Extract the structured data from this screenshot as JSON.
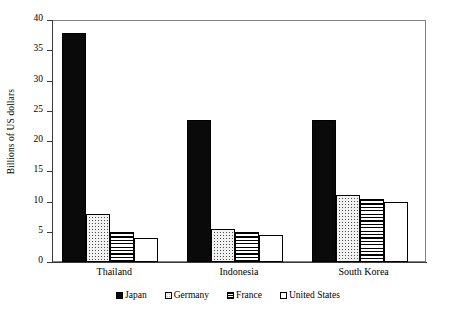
{
  "chart_data": {
    "type": "bar",
    "title": "",
    "subtitle": "",
    "xlabel": "",
    "ylabel": "Billions of US dollars",
    "ylim": [
      0,
      40
    ],
    "yticks": [
      0,
      5,
      10,
      15,
      20,
      25,
      30,
      35,
      40
    ],
    "ytick_labels": [
      "0",
      "5",
      "10",
      "15",
      "20",
      "25",
      "30",
      "35",
      "40"
    ],
    "grid": false,
    "legend_position": "bottom-center",
    "categories": [
      "Thailand",
      "Indonesia",
      "South Korea"
    ],
    "series": [
      {
        "name": "Japan",
        "pattern": "solid-black",
        "color": "#0a0a0a",
        "values": [
          37.8,
          23.5,
          23.5
        ]
      },
      {
        "name": "Germany",
        "pattern": "dotted",
        "color": "#f2f2f2",
        "values": [
          8.0,
          5.4,
          11.0
        ]
      },
      {
        "name": "France",
        "pattern": "horizontal-stripes",
        "color": "#ffffff",
        "values": [
          5.0,
          4.9,
          10.4
        ]
      },
      {
        "name": "United States",
        "pattern": "empty-white",
        "color": "#ffffff",
        "values": [
          4.0,
          4.5,
          10.0
        ]
      }
    ]
  },
  "legend": {
    "items": [
      {
        "label": "Japan",
        "key": "japan"
      },
      {
        "label": "Germany",
        "key": "germany"
      },
      {
        "label": "France",
        "key": "france"
      },
      {
        "label": "United States",
        "key": "unitedstates"
      }
    ]
  }
}
